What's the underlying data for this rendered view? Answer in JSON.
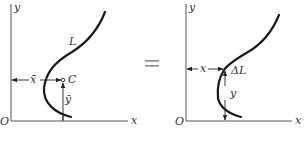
{
  "diagram": {
    "type": "centroid-of-curve",
    "left_panel": {
      "origin_label": "O",
      "x_axis_label": "x",
      "y_axis_label": "y",
      "curve_label": "L",
      "centroid_label": "C",
      "centroid_x_label": "x̄",
      "centroid_y_label": "ȳ"
    },
    "equals_sign": "=",
    "right_panel": {
      "origin_label": "O",
      "x_axis_label": "x",
      "y_axis_label": "y",
      "element_label": "ΔL",
      "element_x_label": "x",
      "element_y_label": "y"
    },
    "colors": {
      "line": "#1a1a1a",
      "axis": "#555555",
      "equals": "#888888"
    }
  }
}
